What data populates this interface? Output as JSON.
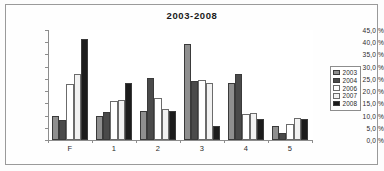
{
  "chart_data": {
    "type": "bar",
    "title": "2003-2008",
    "xlabel": "",
    "ylabel": "",
    "ylim": [
      0,
      45
    ],
    "grid": true,
    "legend_position": "right",
    "categories": [
      "F",
      "1",
      "2",
      "3",
      "4",
      "5"
    ],
    "ytick_labels": [
      "0,0 %",
      "5,0 %",
      "10,0 %",
      "15,0 %",
      "20,0 %",
      "25,0 %",
      "30,0 %",
      "35,0 %",
      "40,0 %",
      "45,0 %"
    ],
    "ytick_values": [
      0,
      5,
      10,
      15,
      20,
      25,
      30,
      35,
      40,
      45
    ],
    "series": [
      {
        "name": "2003",
        "color": "#8f8f8f",
        "values": [
          10.0,
          10.0,
          11.7,
          39.3,
          23.3,
          5.7
        ]
      },
      {
        "name": "2004",
        "color": "#4a4a4a",
        "values": [
          8.0,
          11.3,
          25.5,
          24.0,
          27.0,
          3.0
        ]
      },
      {
        "name": "2006",
        "color": "#ffffff",
        "values": [
          23.0,
          16.0,
          17.3,
          24.5,
          10.7,
          6.7
        ]
      },
      {
        "name": "2007",
        "color": "#f2f2f2",
        "values": [
          27.0,
          16.5,
          12.7,
          23.5,
          11.0,
          9.0
        ]
      },
      {
        "name": "2008",
        "color": "#1c1c1c",
        "values": [
          41.3,
          23.5,
          11.7,
          5.7,
          8.5,
          8.7
        ]
      }
    ]
  },
  "legend": {
    "items": [
      {
        "label": "2003"
      },
      {
        "label": "2004"
      },
      {
        "label": "2006"
      },
      {
        "label": "2007"
      },
      {
        "label": "2008"
      }
    ]
  }
}
